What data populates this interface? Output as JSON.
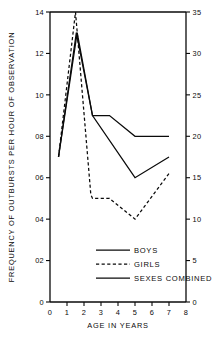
{
  "chart_data": {
    "type": "line",
    "title": "",
    "xlabel": "AGE IN YEARS",
    "ylabel": "FREQUENCY OF OUTBURSTS PER HOUR OF OBSERVATION",
    "ylabel_right": "",
    "xlim": [
      0,
      8
    ],
    "ylim": [
      0,
      14
    ],
    "ylim_right": [
      0,
      35
    ],
    "grid": false,
    "legend_position": "inside-lower-center",
    "xticks": [
      "0",
      "1",
      "2",
      "3",
      "4",
      "5",
      "6",
      "7",
      "8"
    ],
    "xtick_values": [
      0,
      1,
      2,
      3,
      4,
      5,
      6,
      7,
      8
    ],
    "yticks_left": [
      "0",
      "02",
      "04",
      "06",
      "08",
      "10",
      "12",
      "14"
    ],
    "ytick_values_left": [
      0,
      2,
      4,
      6,
      8,
      10,
      12,
      14
    ],
    "yticks_right": [
      "0",
      "5",
      "10",
      "15",
      "20",
      "25",
      "30",
      "35"
    ],
    "ytick_values_right": [
      0,
      5,
      10,
      15,
      20,
      25,
      30,
      35
    ],
    "series": [
      {
        "name": "BOYS",
        "style": "solid",
        "x": [
          0.5,
          1.6,
          2.5,
          3.5,
          5.0,
          7.0
        ],
        "values": [
          7.0,
          13.0,
          9.0,
          9.0,
          8.0,
          8.0
        ]
      },
      {
        "name": "GIRLS",
        "style": "dashed",
        "x": [
          0.5,
          1.5,
          2.4,
          2.5,
          3.5,
          5.0,
          7.0
        ],
        "values": [
          7.0,
          14.0,
          5.2,
          5.0,
          5.0,
          4.0,
          6.2
        ]
      },
      {
        "name": "SEXES COMBINED",
        "style": "solid",
        "x": [
          0.5,
          1.55,
          2.5,
          5.0,
          7.0
        ],
        "values": [
          7.0,
          13.0,
          9.0,
          6.0,
          7.0
        ]
      }
    ]
  },
  "legend": {
    "items": [
      {
        "label": "BOYS",
        "style": "solid"
      },
      {
        "label": "GIRLS",
        "style": "dashed"
      },
      {
        "label": "SEXES COMBINED",
        "style": "solid"
      }
    ]
  },
  "colors": {
    "ink": "#0a0a0a",
    "background": "#ffffff"
  }
}
